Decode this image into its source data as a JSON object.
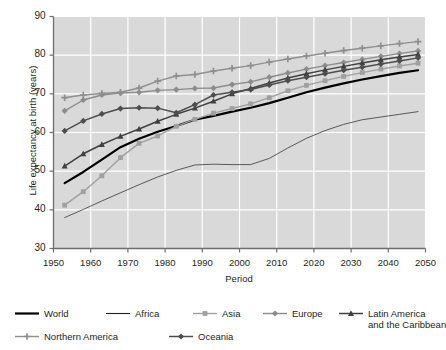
{
  "chart_data": {
    "type": "line",
    "title": "",
    "xlabel": "Period",
    "ylabel": "Life expectancy at birth (years)",
    "xlim": [
      1950,
      2050
    ],
    "ylim": [
      30,
      90
    ],
    "xticks": [
      1950,
      1960,
      1970,
      1980,
      1990,
      2000,
      2010,
      2020,
      2030,
      2040,
      2050
    ],
    "yticks": [
      30,
      40,
      50,
      60,
      70,
      80,
      90
    ],
    "grid": true,
    "legend_position": "bottom",
    "plot_background": "#d9d9d9",
    "x": [
      1953,
      1958,
      1963,
      1968,
      1973,
      1978,
      1983,
      1988,
      1993,
      1998,
      2003,
      2008,
      2013,
      2018,
      2023,
      2028,
      2033,
      2038,
      2043,
      2048
    ],
    "series": [
      {
        "name": "World",
        "color": "#000000",
        "marker": "none",
        "width": 2.2,
        "values": [
          46.9,
          49.8,
          53.0,
          56.2,
          58.4,
          60.2,
          61.7,
          63.3,
          64.3,
          65.4,
          66.4,
          67.6,
          69.0,
          70.4,
          71.6,
          72.7,
          73.7,
          74.6,
          75.4,
          76.1
        ]
      },
      {
        "name": "Africa",
        "color": "#231f20",
        "marker": "none",
        "width": 0.7,
        "values": [
          38.0,
          40.1,
          42.3,
          44.4,
          46.5,
          48.5,
          50.2,
          51.6,
          51.8,
          51.7,
          51.7,
          53.3,
          56.0,
          58.5,
          60.5,
          62.1,
          63.3,
          64.0,
          64.7,
          65.4
        ]
      },
      {
        "name": "Asia",
        "color": "#a0a0a0",
        "marker": "square",
        "width": 1.4,
        "values": [
          41.2,
          44.7,
          48.8,
          53.5,
          57.2,
          59.1,
          61.6,
          63.4,
          65.0,
          66.2,
          67.4,
          69.0,
          70.8,
          72.2,
          73.4,
          74.5,
          75.5,
          76.4,
          77.2,
          77.9
        ]
      },
      {
        "name": "Europe",
        "color": "#8c8c8c",
        "marker": "diamond",
        "width": 1.4,
        "values": [
          65.6,
          68.4,
          69.7,
          70.2,
          70.4,
          70.9,
          71.1,
          71.4,
          71.5,
          72.4,
          73.1,
          74.3,
          75.4,
          76.4,
          77.3,
          78.1,
          78.9,
          79.7,
          80.4,
          81.1
        ]
      },
      {
        "name": "Latin America and the Caribbean",
        "color": "#404040",
        "marker": "triangle",
        "width": 1.5,
        "values": [
          51.3,
          54.5,
          56.9,
          59.0,
          60.9,
          62.9,
          64.7,
          66.3,
          68.1,
          70.0,
          71.4,
          72.8,
          74.1,
          75.2,
          76.2,
          77.1,
          78.0,
          78.8,
          79.5,
          80.2
        ]
      },
      {
        "name": "Northern America",
        "color": "#8f8f8f",
        "marker": "plus",
        "width": 1.4,
        "values": [
          69.0,
          69.7,
          70.1,
          70.4,
          71.5,
          73.3,
          74.6,
          75.0,
          75.9,
          76.6,
          77.3,
          78.2,
          79.0,
          79.8,
          80.5,
          81.2,
          81.8,
          82.4,
          83.0,
          83.5
        ]
      },
      {
        "name": "Oceania",
        "color": "#4d4d4d",
        "marker": "diamond",
        "width": 1.5,
        "values": [
          60.4,
          63.0,
          64.8,
          66.2,
          66.4,
          66.3,
          65.1,
          67.2,
          69.7,
          70.4,
          71.1,
          72.3,
          73.4,
          74.3,
          75.2,
          76.1,
          76.9,
          77.7,
          78.5,
          79.3
        ]
      }
    ]
  },
  "axes": {
    "y_title": "Life expectancy at birth (years)",
    "x_title": "Period",
    "y_tick_labels": [
      "90",
      "80",
      "70",
      "60",
      "50",
      "40",
      "30"
    ],
    "x_tick_labels": [
      "1950",
      "1960",
      "1970",
      "1980",
      "1990",
      "2000",
      "2010",
      "2020",
      "2030",
      "2040",
      "2050"
    ]
  },
  "legend": {
    "items": [
      {
        "label": "World",
        "label2": ""
      },
      {
        "label": "Africa",
        "label2": ""
      },
      {
        "label": "Asia",
        "label2": ""
      },
      {
        "label": "Europe",
        "label2": ""
      },
      {
        "label": "Latin America",
        "label2": "and the Caribbean"
      },
      {
        "label": "Northern America",
        "label2": ""
      },
      {
        "label": "Oceania",
        "label2": ""
      }
    ]
  }
}
